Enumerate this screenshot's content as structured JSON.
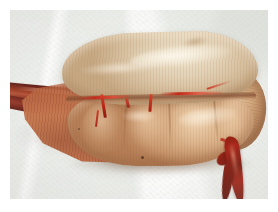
{
  "image": {
    "kind": "photograph",
    "subject": "gross pathology specimen",
    "description": "Resected elongated bilobed organ specimen with attached vascular pedicle, photographed on a white cloth drape",
    "frame": {
      "border_color": "#ffffff",
      "border_px": 10
    },
    "background": {
      "name": "surgical-drape",
      "color": "#f1f3ef",
      "texture": "woven cloth with soft folds"
    },
    "palette": {
      "drape_white": "#f4f5f2",
      "drape_shadow": "#d8dbd5",
      "upper_lobe_pale_tan": "#ddcdb0",
      "lower_lobe_orange_tan": "#d2a87e",
      "wedge_red_brown": "#c5784f",
      "cord_dark_red": "#7a2a1d",
      "vessel_bright_red": "#c3291a",
      "specimen_shadow": "#8c7460"
    },
    "regions": [
      {
        "name": "left-vascular-pedicle",
        "label": "Dark red cord / vessel entering from left edge",
        "color": "#7a2a1d"
      },
      {
        "name": "tapering-wedge",
        "label": "Reddish tapering pole with fine striations",
        "color": "#c5784f"
      },
      {
        "name": "upper-lobe",
        "label": "Pale translucent tan upper lobe with glossy serosal surface",
        "color": "#ddcdb0"
      },
      {
        "name": "mid-fissure",
        "label": "Groove separating upper and lower lobes",
        "color": "#7c482e"
      },
      {
        "name": "lower-lobe",
        "label": "Orange-tan lobulated lower body, four segments",
        "color": "#d2a87e"
      },
      {
        "name": "right-pole",
        "label": "Rounded bulbous right pole",
        "color": "#d4aa80"
      },
      {
        "name": "right-descending-cord",
        "label": "Dark red vessel descending to lower right",
        "color": "#8e1f12"
      },
      {
        "name": "surface-vessels",
        "label": "Bright red vessels crossing the surface",
        "color": "#c3291a"
      }
    ]
  }
}
